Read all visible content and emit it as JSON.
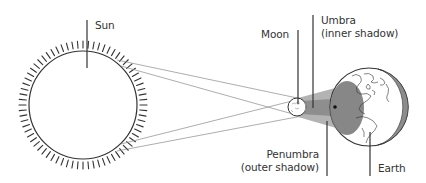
{
  "diagram": {
    "labels": {
      "sun": "Sun",
      "moon": "Moon",
      "umbra_line1": "Umbra",
      "umbra_line2": "(inner shadow)",
      "penumbra_line1": "Penumbra",
      "penumbra_line2": "(outer shadow)",
      "earth": "Earth"
    },
    "colors": {
      "outline": "#333333",
      "rays": "#8a8a8a",
      "penumbra_fill": "#a8a8a8",
      "umbra_fill": "#6f6f6f",
      "earth_night": "#8c8c8c",
      "background": "#ffffff"
    },
    "bodies": {
      "sun": {
        "cx": 83,
        "cy": 105,
        "r": 54
      },
      "moon": {
        "cx": 297,
        "cy": 107,
        "r": 9
      },
      "earth": {
        "cx": 369,
        "cy": 107,
        "r": 39
      }
    }
  }
}
